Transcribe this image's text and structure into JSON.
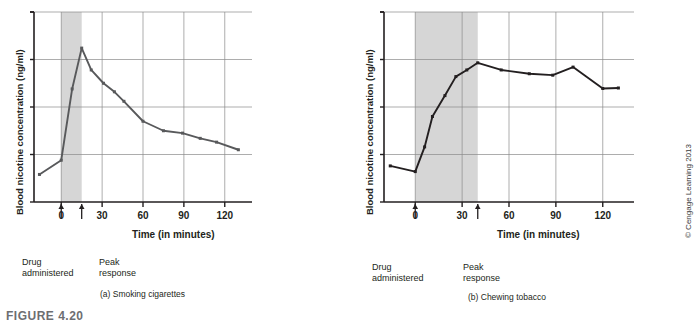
{
  "figure": {
    "label": "FIGURE 4.20",
    "copyright": "© Cengage Learning 2013"
  },
  "chart_data": [
    {
      "type": "line",
      "panel_id": "a",
      "title": "(a) Smoking cigarettes",
      "xlabel": "Time (in minutes)",
      "ylabel": "Blood nicotine concentration (ng/ml)",
      "xlim": [
        -20,
        140
      ],
      "ylim": [
        0,
        20
      ],
      "xticks": [
        0,
        30,
        60,
        90,
        120
      ],
      "yticks": [
        0,
        5,
        10,
        15,
        20
      ],
      "grid": true,
      "legend": "none",
      "shaded_region": {
        "label": "smoking period",
        "x_start": 0,
        "x_end": 15,
        "color": "#d6d6d6"
      },
      "annotations": [
        {
          "name": "drug-administered",
          "text_line1": "Drug",
          "text_line2": "administered",
          "x": 0
        },
        {
          "name": "peak-response",
          "text_line1": "Peak",
          "text_line2": "response",
          "x": 15
        }
      ],
      "series": [
        {
          "name": "Blood nicotine concentration",
          "color": "#58595b",
          "x": [
            -16,
            0,
            8,
            15,
            22,
            31,
            39,
            46,
            60,
            75,
            89,
            102,
            114,
            130
          ],
          "y": [
            2.9,
            4.4,
            11.9,
            16.2,
            13.9,
            12.5,
            11.6,
            10.6,
            8.5,
            7.5,
            7.25,
            6.7,
            6.3,
            5.5
          ]
        }
      ]
    },
    {
      "type": "line",
      "panel_id": "b",
      "title": "(b) Chewing tobacco",
      "xlabel": "Time (in minutes)",
      "ylabel": "Blood nicotine concentration (ng/ml)",
      "xlim": [
        -20,
        140
      ],
      "ylim": [
        0,
        20
      ],
      "xticks": [
        0,
        30,
        60,
        90,
        120
      ],
      "yticks": [
        0,
        5,
        10,
        15,
        20
      ],
      "grid": true,
      "legend": "none",
      "shaded_region": {
        "label": "chewing period",
        "x_start": 0,
        "x_end": 40,
        "color": "#d6d6d6"
      },
      "annotations": [
        {
          "name": "drug-administered",
          "text_line1": "Drug",
          "text_line2": "administered",
          "x": 0
        },
        {
          "name": "peak-response",
          "text_line1": "Peak",
          "text_line2": "response",
          "x": 40
        }
      ],
      "series": [
        {
          "name": "Blood nicotine concentration",
          "color": "#231f20",
          "x": [
            -16,
            0,
            6,
            11,
            19,
            26,
            33,
            40,
            55,
            73,
            88,
            101,
            120,
            130
          ],
          "y": [
            3.8,
            3.2,
            5.8,
            9.0,
            11.2,
            13.2,
            13.9,
            14.65,
            13.9,
            13.5,
            13.35,
            14.2,
            11.95,
            12.0
          ]
        }
      ]
    }
  ]
}
